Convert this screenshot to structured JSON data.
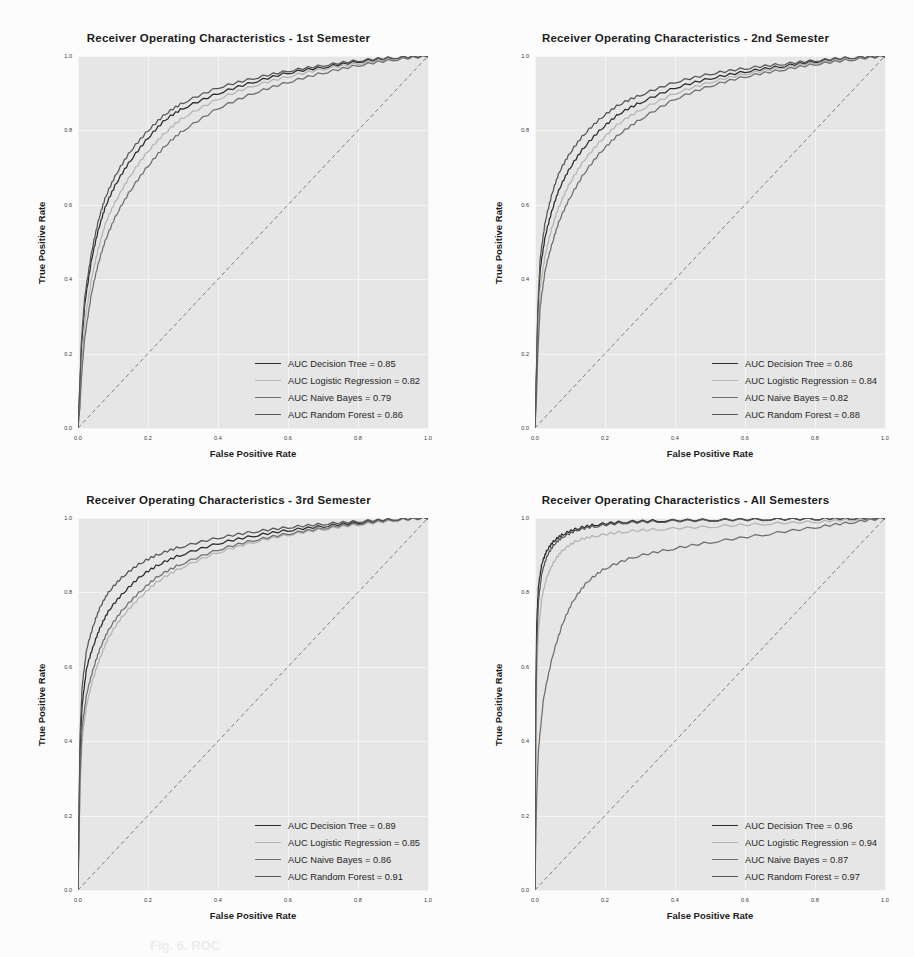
{
  "figure": {
    "background": "#fcfcfc",
    "plot_background": "#e6e6e6",
    "grid_color": "#f4f4f4",
    "caption_fragment": "Fig. 6. ROC"
  },
  "axes": {
    "xlabel": "False Positive Rate",
    "ylabel": "True Positive Rate",
    "xticks": [
      "0.0",
      "0.2",
      "0.4",
      "0.6",
      "0.8",
      "1.0"
    ],
    "yticks": [
      "0.0",
      "0.2",
      "0.4",
      "0.6",
      "0.8",
      "1.0"
    ],
    "xlim": [
      0.0,
      1.0
    ],
    "ylim": [
      0.0,
      1.0
    ],
    "grid": true
  },
  "series_colors": {
    "decision_tree": "#2b2b2b",
    "logistic_regression": "#b4b4b4",
    "naive_bayes": "#6e6e6e",
    "random_forest": "#565656",
    "chance": "#707070"
  },
  "chart_data": [
    {
      "type": "line",
      "title": "Receiver Operating Characteristics - 1st Semester",
      "xlabel": "False Positive Rate",
      "ylabel": "True Positive Rate",
      "xlim": [
        0.0,
        1.0
      ],
      "ylim": [
        0.0,
        1.0
      ],
      "grid": true,
      "legend_position": "lower-right",
      "legend": [
        {
          "label": "AUC Decision Tree = 0.85",
          "model": "Decision Tree",
          "auc": 0.85,
          "color": "#2b2b2b"
        },
        {
          "label": "AUC Logistic Regression = 0.82",
          "model": "Logistic Regression",
          "auc": 0.82,
          "color": "#b4b4b4"
        },
        {
          "label": "AUC Naive Bayes = 0.79",
          "model": "Naive Bayes",
          "auc": 0.79,
          "color": "#6e6e6e"
        },
        {
          "label": "AUC Random Forest = 0.86",
          "model": "Random Forest",
          "auc": 0.86,
          "color": "#565656"
        }
      ],
      "series": [
        {
          "name": "Decision Tree",
          "auc": 0.85,
          "x": [
            0.0,
            0.005,
            0.01,
            0.02,
            0.04,
            0.06,
            0.08,
            0.11,
            0.15,
            0.2,
            0.25,
            0.3,
            0.4,
            0.5,
            0.6,
            0.7,
            0.8,
            0.9,
            1.0
          ],
          "y": [
            0.0,
            0.1,
            0.22,
            0.34,
            0.46,
            0.54,
            0.6,
            0.66,
            0.72,
            0.78,
            0.83,
            0.86,
            0.9,
            0.93,
            0.955,
            0.97,
            0.985,
            0.995,
            1.0
          ]
        },
        {
          "name": "Logistic Regression",
          "auc": 0.82,
          "x": [
            0.0,
            0.005,
            0.01,
            0.02,
            0.04,
            0.06,
            0.08,
            0.11,
            0.15,
            0.2,
            0.25,
            0.3,
            0.4,
            0.5,
            0.6,
            0.7,
            0.8,
            0.9,
            1.0
          ],
          "y": [
            0.0,
            0.06,
            0.17,
            0.29,
            0.41,
            0.49,
            0.555,
            0.615,
            0.68,
            0.745,
            0.795,
            0.835,
            0.885,
            0.92,
            0.945,
            0.965,
            0.98,
            0.992,
            1.0
          ]
        },
        {
          "name": "Naive Bayes",
          "auc": 0.79,
          "x": [
            0.0,
            0.005,
            0.01,
            0.02,
            0.04,
            0.06,
            0.08,
            0.11,
            0.15,
            0.2,
            0.25,
            0.3,
            0.4,
            0.5,
            0.6,
            0.7,
            0.8,
            0.9,
            1.0
          ],
          "y": [
            0.0,
            0.05,
            0.14,
            0.25,
            0.37,
            0.45,
            0.51,
            0.575,
            0.64,
            0.705,
            0.76,
            0.8,
            0.86,
            0.9,
            0.93,
            0.955,
            0.975,
            0.99,
            1.0
          ]
        },
        {
          "name": "Random Forest",
          "auc": 0.86,
          "x": [
            0.0,
            0.005,
            0.01,
            0.02,
            0.04,
            0.06,
            0.08,
            0.11,
            0.15,
            0.2,
            0.25,
            0.3,
            0.4,
            0.5,
            0.6,
            0.7,
            0.8,
            0.9,
            1.0
          ],
          "y": [
            0.0,
            0.11,
            0.24,
            0.36,
            0.48,
            0.565,
            0.625,
            0.685,
            0.745,
            0.8,
            0.845,
            0.875,
            0.915,
            0.94,
            0.96,
            0.975,
            0.988,
            0.996,
            1.0
          ]
        },
        {
          "name": "Chance",
          "auc": 0.5,
          "dashed": true,
          "x": [
            0.0,
            1.0
          ],
          "y": [
            0.0,
            1.0
          ]
        }
      ]
    },
    {
      "type": "line",
      "title": "Receiver Operating Characteristics - 2nd Semester",
      "xlabel": "False Positive Rate",
      "ylabel": "True Positive Rate",
      "xlim": [
        0.0,
        1.0
      ],
      "ylim": [
        0.0,
        1.0
      ],
      "grid": true,
      "legend_position": "lower-right",
      "legend": [
        {
          "label": "AUC Decision Tree = 0.86",
          "model": "Decision Tree",
          "auc": 0.86,
          "color": "#2b2b2b"
        },
        {
          "label": "AUC Logistic Regression = 0.84",
          "model": "Logistic Regression",
          "auc": 0.84,
          "color": "#b4b4b4"
        },
        {
          "label": "AUC Naive Bayes = 0.82",
          "model": "Naive Bayes",
          "auc": 0.82,
          "color": "#6e6e6e"
        },
        {
          "label": "AUC Random Forest = 0.88",
          "model": "Random Forest",
          "auc": 0.88,
          "color": "#565656"
        }
      ],
      "series": [
        {
          "name": "Decision Tree",
          "auc": 0.86,
          "x": [
            0.0,
            0.004,
            0.008,
            0.015,
            0.03,
            0.05,
            0.07,
            0.1,
            0.14,
            0.19,
            0.24,
            0.3,
            0.4,
            0.5,
            0.6,
            0.7,
            0.8,
            0.9,
            1.0
          ],
          "y": [
            0.0,
            0.15,
            0.3,
            0.43,
            0.52,
            0.59,
            0.645,
            0.7,
            0.755,
            0.805,
            0.845,
            0.875,
            0.915,
            0.94,
            0.958,
            0.972,
            0.985,
            0.995,
            1.0
          ]
        },
        {
          "name": "Logistic Regression",
          "auc": 0.84,
          "x": [
            0.0,
            0.004,
            0.008,
            0.015,
            0.03,
            0.05,
            0.07,
            0.1,
            0.14,
            0.19,
            0.24,
            0.3,
            0.4,
            0.5,
            0.6,
            0.7,
            0.8,
            0.9,
            1.0
          ],
          "y": [
            0.0,
            0.1,
            0.24,
            0.38,
            0.47,
            0.545,
            0.6,
            0.66,
            0.72,
            0.775,
            0.82,
            0.855,
            0.9,
            0.93,
            0.952,
            0.968,
            0.982,
            0.993,
            1.0
          ]
        },
        {
          "name": "Naive Bayes",
          "auc": 0.82,
          "x": [
            0.0,
            0.004,
            0.008,
            0.015,
            0.03,
            0.05,
            0.07,
            0.1,
            0.14,
            0.19,
            0.24,
            0.3,
            0.4,
            0.5,
            0.6,
            0.7,
            0.8,
            0.9,
            1.0
          ],
          "y": [
            0.0,
            0.08,
            0.2,
            0.33,
            0.43,
            0.5,
            0.56,
            0.62,
            0.685,
            0.745,
            0.79,
            0.83,
            0.885,
            0.92,
            0.945,
            0.962,
            0.978,
            0.99,
            1.0
          ]
        },
        {
          "name": "Random Forest",
          "auc": 0.88,
          "x": [
            0.0,
            0.004,
            0.008,
            0.015,
            0.03,
            0.05,
            0.07,
            0.1,
            0.14,
            0.19,
            0.24,
            0.3,
            0.4,
            0.5,
            0.6,
            0.7,
            0.8,
            0.9,
            1.0
          ],
          "y": [
            0.0,
            0.14,
            0.32,
            0.46,
            0.56,
            0.635,
            0.69,
            0.74,
            0.79,
            0.835,
            0.87,
            0.895,
            0.93,
            0.952,
            0.967,
            0.978,
            0.988,
            0.996,
            1.0
          ]
        },
        {
          "name": "Chance",
          "auc": 0.5,
          "dashed": true,
          "x": [
            0.0,
            1.0
          ],
          "y": [
            0.0,
            1.0
          ]
        }
      ]
    },
    {
      "type": "line",
      "title": "Receiver Operating Characteristics - 3rd Semester",
      "xlabel": "False Positive Rate",
      "ylabel": "True Positive Rate",
      "xlim": [
        0.0,
        1.0
      ],
      "ylim": [
        0.0,
        1.0
      ],
      "grid": true,
      "legend_position": "lower-right",
      "legend": [
        {
          "label": "AUC Decision Tree = 0.89",
          "model": "Decision Tree",
          "auc": 0.89,
          "color": "#2b2b2b"
        },
        {
          "label": "AUC Logistic Regression = 0.85",
          "model": "Logistic Regression",
          "auc": 0.85,
          "color": "#b4b4b4"
        },
        {
          "label": "AUC Naive Bayes = 0.86",
          "model": "Naive Bayes",
          "auc": 0.86,
          "color": "#6e6e6e"
        },
        {
          "label": "AUC Random Forest = 0.91",
          "model": "Random Forest",
          "auc": 0.91,
          "color": "#565656"
        }
      ],
      "series": [
        {
          "name": "Decision Tree",
          "auc": 0.89,
          "x": [
            0.0,
            0.003,
            0.006,
            0.012,
            0.025,
            0.045,
            0.065,
            0.09,
            0.13,
            0.18,
            0.23,
            0.29,
            0.4,
            0.5,
            0.6,
            0.7,
            0.8,
            0.9,
            1.0
          ],
          "y": [
            0.0,
            0.2,
            0.38,
            0.5,
            0.6,
            0.66,
            0.71,
            0.755,
            0.8,
            0.845,
            0.875,
            0.9,
            0.932,
            0.952,
            0.967,
            0.978,
            0.988,
            0.996,
            1.0
          ]
        },
        {
          "name": "Logistic Regression",
          "auc": 0.85,
          "x": [
            0.0,
            0.003,
            0.006,
            0.012,
            0.025,
            0.045,
            0.065,
            0.09,
            0.13,
            0.18,
            0.23,
            0.29,
            0.4,
            0.5,
            0.6,
            0.7,
            0.8,
            0.9,
            1.0
          ],
          "y": [
            0.0,
            0.13,
            0.28,
            0.41,
            0.5,
            0.575,
            0.63,
            0.685,
            0.74,
            0.79,
            0.832,
            0.865,
            0.908,
            0.935,
            0.955,
            0.97,
            0.982,
            0.993,
            1.0
          ]
        },
        {
          "name": "Naive Bayes",
          "auc": 0.86,
          "x": [
            0.0,
            0.003,
            0.006,
            0.012,
            0.025,
            0.045,
            0.065,
            0.09,
            0.13,
            0.18,
            0.23,
            0.29,
            0.4,
            0.5,
            0.6,
            0.7,
            0.8,
            0.9,
            1.0
          ],
          "y": [
            0.0,
            0.15,
            0.31,
            0.44,
            0.53,
            0.6,
            0.655,
            0.705,
            0.757,
            0.805,
            0.845,
            0.875,
            0.915,
            0.94,
            0.958,
            0.973,
            0.985,
            0.995,
            1.0
          ]
        },
        {
          "name": "Random Forest",
          "auc": 0.91,
          "x": [
            0.0,
            0.003,
            0.006,
            0.012,
            0.025,
            0.045,
            0.065,
            0.09,
            0.13,
            0.18,
            0.23,
            0.29,
            0.4,
            0.5,
            0.6,
            0.7,
            0.8,
            0.9,
            1.0
          ],
          "y": [
            0.0,
            0.22,
            0.42,
            0.55,
            0.65,
            0.715,
            0.765,
            0.805,
            0.845,
            0.88,
            0.903,
            0.922,
            0.947,
            0.963,
            0.975,
            0.984,
            0.991,
            0.997,
            1.0
          ]
        },
        {
          "name": "Chance",
          "auc": 0.5,
          "dashed": true,
          "x": [
            0.0,
            1.0
          ],
          "y": [
            0.0,
            1.0
          ]
        }
      ]
    },
    {
      "type": "line",
      "title": "Receiver Operating Characteristics - All Semesters",
      "xlabel": "False Positive Rate",
      "ylabel": "True Positive Rate",
      "xlim": [
        0.0,
        1.0
      ],
      "ylim": [
        0.0,
        1.0
      ],
      "grid": true,
      "legend_position": "lower-right",
      "legend": [
        {
          "label": "AUC Decision Tree = 0.96",
          "model": "Decision Tree",
          "auc": 0.96,
          "color": "#2b2b2b"
        },
        {
          "label": "AUC Logistic Regression = 0.94",
          "model": "Logistic Regression",
          "auc": 0.94,
          "color": "#b4b4b4"
        },
        {
          "label": "AUC Naive Bayes = 0.87",
          "model": "Naive Bayes",
          "auc": 0.87,
          "color": "#6e6e6e"
        },
        {
          "label": "AUC Random Forest = 0.97",
          "model": "Random Forest",
          "auc": 0.97,
          "color": "#565656"
        }
      ],
      "series": [
        {
          "name": "Decision Tree",
          "auc": 0.96,
          "x": [
            0.0,
            0.002,
            0.005,
            0.01,
            0.02,
            0.035,
            0.055,
            0.08,
            0.12,
            0.17,
            0.25,
            0.35,
            0.5,
            0.65,
            0.8,
            0.9,
            1.0
          ],
          "y": [
            0.0,
            0.5,
            0.72,
            0.82,
            0.88,
            0.915,
            0.94,
            0.957,
            0.972,
            0.982,
            0.99,
            0.993,
            0.995,
            0.997,
            0.998,
            0.999,
            1.0
          ]
        },
        {
          "name": "Logistic Regression",
          "auc": 0.94,
          "x": [
            0.0,
            0.002,
            0.005,
            0.01,
            0.02,
            0.035,
            0.055,
            0.08,
            0.12,
            0.17,
            0.25,
            0.35,
            0.5,
            0.65,
            0.8,
            0.9,
            1.0
          ],
          "y": [
            0.0,
            0.36,
            0.58,
            0.7,
            0.79,
            0.845,
            0.885,
            0.915,
            0.94,
            0.952,
            0.963,
            0.97,
            0.977,
            0.984,
            0.99,
            0.995,
            1.0
          ]
        },
        {
          "name": "Naive Bayes",
          "auc": 0.87,
          "x": [
            0.0,
            0.002,
            0.005,
            0.01,
            0.025,
            0.05,
            0.08,
            0.11,
            0.15,
            0.2,
            0.28,
            0.38,
            0.5,
            0.65,
            0.8,
            0.9,
            1.0
          ],
          "y": [
            0.0,
            0.12,
            0.26,
            0.38,
            0.52,
            0.63,
            0.72,
            0.78,
            0.83,
            0.865,
            0.895,
            0.915,
            0.935,
            0.955,
            0.975,
            0.988,
            1.0
          ]
        },
        {
          "name": "Random Forest",
          "auc": 0.97,
          "x": [
            0.0,
            0.002,
            0.005,
            0.01,
            0.02,
            0.035,
            0.055,
            0.08,
            0.12,
            0.17,
            0.25,
            0.35,
            0.5,
            0.65,
            0.8,
            0.9,
            1.0
          ],
          "y": [
            0.0,
            0.44,
            0.66,
            0.78,
            0.855,
            0.9,
            0.93,
            0.95,
            0.968,
            0.978,
            0.987,
            0.991,
            0.994,
            0.996,
            0.998,
            0.999,
            1.0
          ]
        },
        {
          "name": "Chance",
          "auc": 0.5,
          "dashed": true,
          "x": [
            0.0,
            1.0
          ],
          "y": [
            0.0,
            1.0
          ]
        }
      ]
    }
  ]
}
